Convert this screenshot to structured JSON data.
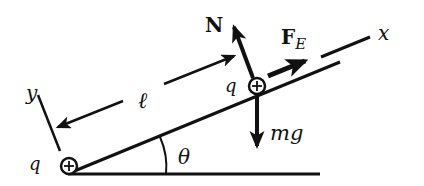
{
  "diagram": {
    "labels": {
      "normal_force": "N",
      "electric_force": "F",
      "electric_force_sub": "E",
      "weight": "mg",
      "x_axis": "x",
      "y_axis": "y",
      "distance": "ℓ",
      "angle": "θ",
      "charge_top": "q",
      "charge_bottom": "q"
    },
    "colors": {
      "ink": "#111111",
      "background": "#ffffff"
    }
  }
}
